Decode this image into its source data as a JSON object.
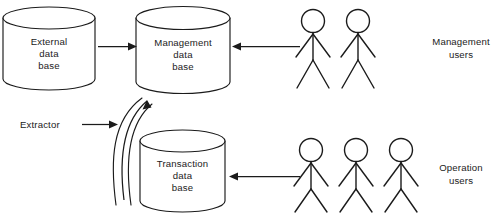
{
  "diagram": {
    "background_color": "#ffffff",
    "line_color": "#1b1b1b",
    "databases": [
      {
        "id": "external-database",
        "line1": "External",
        "line2": "data",
        "line3": "base"
      },
      {
        "id": "management-database",
        "line1": "Management",
        "line2": "data",
        "line3": "base"
      },
      {
        "id": "transaction-database",
        "line1": "Transaction",
        "line2": "data",
        "line3": "base"
      }
    ],
    "labels": {
      "extractor": "Extractor",
      "management_users_line1": "Management",
      "management_users_line2": "users",
      "operation_users_line1": "Operation",
      "operation_users_line2": "users"
    },
    "user_groups": [
      {
        "id": "management-users",
        "figure_count": 2
      },
      {
        "id": "operation-users",
        "figure_count": 3
      }
    ],
    "arrows": [
      {
        "id": "external-to-management",
        "direction": "right"
      },
      {
        "id": "management-users-to-management-db",
        "direction": "left"
      },
      {
        "id": "operation-users-to-transaction-db",
        "direction": "left"
      },
      {
        "id": "extractor-pointer",
        "direction": "right"
      },
      {
        "id": "extractor-flow",
        "direction": "up-curved"
      }
    ]
  }
}
